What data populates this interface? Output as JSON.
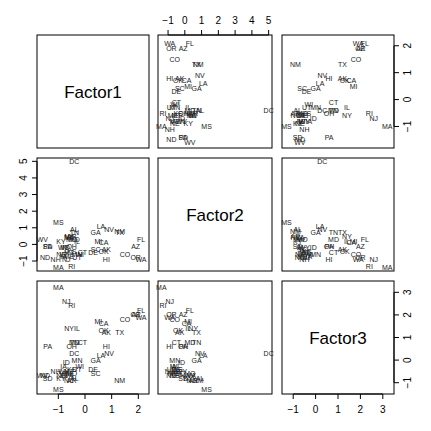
{
  "chart_data": {
    "type": "scatter",
    "subtype": "scatterplot-matrix",
    "title": "",
    "variables": [
      "Factor1",
      "Factor2",
      "Factor3"
    ],
    "point_labels_are": "US state abbreviations",
    "axes": {
      "Factor1": {
        "ticks": [
          -1,
          0,
          1,
          2
        ],
        "range": [
          -1.8,
          2.4
        ]
      },
      "Factor2": {
        "ticks": [
          -1,
          0,
          1,
          2,
          3,
          4,
          5
        ],
        "range": [
          -1.6,
          5.2
        ]
      },
      "Factor3": {
        "ticks": [
          -1,
          0,
          1,
          2,
          3
        ],
        "range": [
          -1.5,
          3.5
        ]
      }
    },
    "axis_tick_placement": {
      "Factor1": {
        "bottom_of_col": 1,
        "right_of_row": 1
      },
      "Factor2": {
        "top_of_col": 2,
        "left_of_row": 2
      },
      "Factor3": {
        "right_of_row": 3,
        "bottom_of_col": 3
      }
    },
    "grid": false,
    "legend": null,
    "points": [
      {
        "label": "AK",
        "f1": 0.8,
        "f2": -0.3,
        "f3": 1.2
      },
      {
        "label": "AL",
        "f1": -0.4,
        "f2": 0.9,
        "f3": -0.8
      },
      {
        "label": "AR",
        "f1": -0.5,
        "f2": 0.5,
        "f3": -0.9
      },
      {
        "label": "AZ",
        "f1": 1.9,
        "f2": -0.1,
        "f3": 2.0
      },
      {
        "label": "CA",
        "f1": 0.7,
        "f2": 0.1,
        "f3": 1.6
      },
      {
        "label": "CO",
        "f1": 1.5,
        "f2": -0.6,
        "f3": 1.8
      },
      {
        "label": "CT",
        "f1": -0.1,
        "f2": -0.5,
        "f3": 0.8
      },
      {
        "label": "DC",
        "f1": -0.4,
        "f2": 5.0,
        "f3": 0.3
      },
      {
        "label": "DE",
        "f1": 0.3,
        "f2": -0.5,
        "f3": -0.4
      },
      {
        "label": "FL",
        "f1": 2.1,
        "f2": 0.3,
        "f3": 2.2
      },
      {
        "label": "GA",
        "f1": 0.4,
        "f2": 0.7,
        "f3": 0.0
      },
      {
        "label": "HI",
        "f1": 0.8,
        "f2": -0.9,
        "f3": 0.6
      },
      {
        "label": "IA",
        "f1": -0.8,
        "f2": -0.7,
        "f3": -0.3
      },
      {
        "label": "ID",
        "f1": -0.7,
        "f2": -0.2,
        "f3": -0.1
      },
      {
        "label": "IL",
        "f1": -0.3,
        "f2": 0.2,
        "f3": 1.4
      },
      {
        "label": "IN",
        "f1": -0.8,
        "f2": -0.2,
        "f3": -0.7
      },
      {
        "label": "KS",
        "f1": -0.5,
        "f2": -0.4,
        "f3": -0.4
      },
      {
        "label": "KY",
        "f1": -0.9,
        "f2": 0.2,
        "f3": -0.8
      },
      {
        "label": "LA",
        "f1": 0.6,
        "f2": 1.1,
        "f3": 0.2
      },
      {
        "label": "MA",
        "f1": -1.0,
        "f2": -1.4,
        "f3": 3.2
      },
      {
        "label": "MD",
        "f1": -0.4,
        "f2": 0.3,
        "f3": 0.8
      },
      {
        "label": "ME",
        "f1": -0.6,
        "f2": -0.7,
        "f3": -0.6
      },
      {
        "label": "MI",
        "f1": 0.5,
        "f2": 0.2,
        "f3": 1.7
      },
      {
        "label": "MN",
        "f1": -0.3,
        "f2": -0.6,
        "f3": 0.0
      },
      {
        "label": "MO",
        "f1": -0.5,
        "f2": 0.3,
        "f3": -0.6
      },
      {
        "label": "MS",
        "f1": -1.0,
        "f2": 1.3,
        "f3": -1.3
      },
      {
        "label": "MT",
        "f1": -0.6,
        "f2": -0.5,
        "f3": -0.5
      },
      {
        "label": "NC",
        "f1": -0.6,
        "f2": 0.4,
        "f3": -0.9
      },
      {
        "label": "ND",
        "f1": -1.5,
        "f2": -0.8,
        "f3": -0.7
      },
      {
        "label": "NE",
        "f1": -0.9,
        "f2": -0.6,
        "f3": -0.7
      },
      {
        "label": "NH",
        "f1": -1.1,
        "f2": -0.9,
        "f3": -0.5
      },
      {
        "label": "NJ",
        "f1": -0.7,
        "f2": -0.9,
        "f3": 2.6
      },
      {
        "label": "NM",
        "f1": 1.3,
        "f2": 0.8,
        "f3": -0.9
      },
      {
        "label": "NV",
        "f1": 0.9,
        "f2": 0.9,
        "f3": 0.3
      },
      {
        "label": "NY",
        "f1": -0.6,
        "f2": 0.5,
        "f3": 1.4
      },
      {
        "label": "OH",
        "f1": -0.5,
        "f2": -0.1,
        "f3": 0.6
      },
      {
        "label": "OK",
        "f1": 0.7,
        "f2": -0.4,
        "f3": 1.3
      },
      {
        "label": "OR",
        "f1": 1.9,
        "f2": -0.8,
        "f3": 2.0
      },
      {
        "label": "PA",
        "f1": -1.4,
        "f2": -0.1,
        "f3": 0.6
      },
      {
        "label": "RI",
        "f1": -0.5,
        "f2": -1.3,
        "f3": 2.4
      },
      {
        "label": "SC",
        "f1": 0.4,
        "f2": -0.3,
        "f3": -0.6
      },
      {
        "label": "SD",
        "f1": -1.4,
        "f2": -0.1,
        "f3": -0.8
      },
      {
        "label": "TN",
        "f1": -0.4,
        "f2": 0.7,
        "f3": 0.8
      },
      {
        "label": "TX",
        "f1": 1.3,
        "f2": 0.7,
        "f3": 1.2
      },
      {
        "label": "UT",
        "f1": -0.3,
        "f2": -0.8,
        "f3": -0.4
      },
      {
        "label": "VA",
        "f1": -0.6,
        "f2": 0.4,
        "f3": -0.7
      },
      {
        "label": "VT",
        "f1": -0.8,
        "f2": -0.6,
        "f3": -0.6
      },
      {
        "label": "WA",
        "f1": 2.1,
        "f2": -0.9,
        "f3": 1.9
      },
      {
        "label": "WI",
        "f1": -0.2,
        "f2": -0.6,
        "f3": -0.3
      },
      {
        "label": "WV",
        "f1": -1.6,
        "f2": 0.3,
        "f3": -0.7
      },
      {
        "label": "WY",
        "f1": -0.8,
        "f2": -0.2,
        "f3": -0.5
      }
    ]
  }
}
